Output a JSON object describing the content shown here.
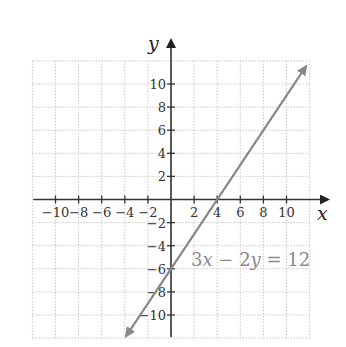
{
  "chart_data": {
    "type": "line",
    "title": "",
    "xlabel": "x",
    "ylabel": "y",
    "xlim": [
      -12,
      12
    ],
    "ylim": [
      -12,
      12
    ],
    "grid": true,
    "grid_step": 2,
    "x_ticks": [
      -10,
      -8,
      -6,
      -4,
      -2,
      2,
      4,
      6,
      8,
      10
    ],
    "y_ticks": [
      10,
      8,
      6,
      4,
      2,
      -2,
      -4,
      -6,
      -8,
      -10
    ],
    "x_tick_labels": [
      "−10",
      "−8",
      "−6",
      "−4",
      "−2",
      "2",
      "4",
      "6",
      "8",
      "10"
    ],
    "y_tick_labels": [
      "10",
      "8",
      "6",
      "4",
      "2",
      "−2",
      "−4",
      "−6",
      "−8",
      "−10"
    ],
    "series": [
      {
        "name": "3x − 2y = 12",
        "equation": "3x - 2y = 12",
        "slope": 1.5,
        "y_intercept": -6,
        "x_intercept": 4,
        "x": [
          -3.9,
          11.7
        ],
        "y": [
          -11.85,
          11.55
        ],
        "arrows": "both",
        "color": "#888888"
      }
    ],
    "annotations": [
      {
        "text": "3x − 2y = 12",
        "x": 1.8,
        "y": -5.8
      }
    ],
    "colors": {
      "axis": "#333333",
      "grid": "#c8c8c8",
      "line": "#888888",
      "label": "#8a8a8a"
    }
  },
  "labels": {
    "x_axis": "x",
    "y_axis": "y",
    "equation_parts": [
      "3",
      "x",
      " − 2",
      "y",
      " = 12"
    ]
  }
}
